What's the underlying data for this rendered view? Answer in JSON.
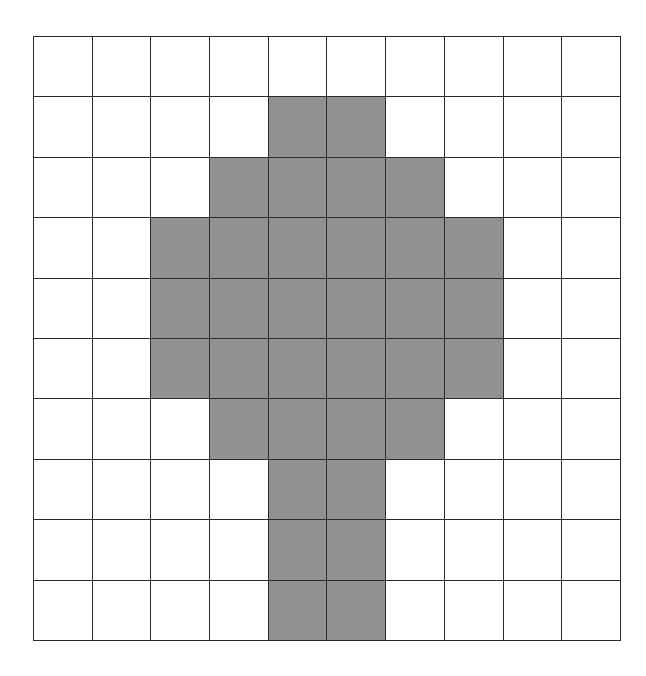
{
  "figure": {
    "name": "shaded-grid-figure",
    "rows": 10,
    "columns": 10,
    "fill_color": "#919191",
    "empty_color": "#ffffff",
    "line_color": "#2b2b2b",
    "background_color": "#ffffff"
  },
  "chart_data": {
    "type": "heatmap",
    "title": "",
    "subtitle": "",
    "xlabel": "",
    "ylabel": "",
    "grid": true,
    "legend": "none",
    "rows": 10,
    "columns": 10,
    "row_labels": [
      "1",
      "2",
      "3",
      "4",
      "5",
      "6",
      "7",
      "8",
      "9",
      "10"
    ],
    "column_labels": [
      "1",
      "2",
      "3",
      "4",
      "5",
      "6",
      "7",
      "8",
      "9",
      "10"
    ],
    "value_map": {
      "0": "empty",
      "1": "shaded"
    },
    "colors": {
      "0": "#ffffff",
      "1": "#919191"
    },
    "shaded_count": 32,
    "empty_count": 68,
    "shaded_cells_per_row": [
      0,
      2,
      4,
      6,
      6,
      6,
      4,
      2,
      2,
      2
    ],
    "values": [
      [
        0,
        0,
        0,
        0,
        0,
        0,
        0,
        0,
        0,
        0
      ],
      [
        0,
        0,
        0,
        0,
        1,
        1,
        0,
        0,
        0,
        0
      ],
      [
        0,
        0,
        0,
        1,
        1,
        1,
        1,
        0,
        0,
        0
      ],
      [
        0,
        0,
        1,
        1,
        1,
        1,
        1,
        1,
        0,
        0
      ],
      [
        0,
        0,
        1,
        1,
        1,
        1,
        1,
        1,
        0,
        0
      ],
      [
        0,
        0,
        1,
        1,
        1,
        1,
        1,
        1,
        0,
        0
      ],
      [
        0,
        0,
        0,
        1,
        1,
        1,
        1,
        0,
        0,
        0
      ],
      [
        0,
        0,
        0,
        0,
        1,
        1,
        0,
        0,
        0,
        0
      ],
      [
        0,
        0,
        0,
        0,
        1,
        1,
        0,
        0,
        0,
        0
      ],
      [
        0,
        0,
        0,
        0,
        1,
        1,
        0,
        0,
        0,
        0
      ]
    ]
  }
}
